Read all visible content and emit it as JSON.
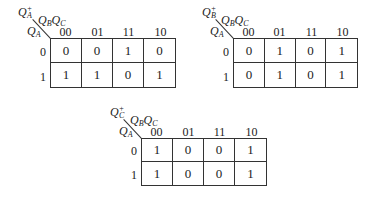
{
  "column_labels": [
    "00",
    "01",
    "11",
    "10"
  ],
  "row_labels": [
    "0",
    "1"
  ],
  "maps": [
    {
      "id": "qa",
      "output": {
        "base": "Q",
        "sub": "A",
        "sup": "+"
      },
      "col_var": {
        "v1": "Q",
        "s1": "B",
        "v2": "Q",
        "s2": "C"
      },
      "row_var": {
        "base": "Q",
        "sub": "A"
      },
      "rows": [
        [
          "0",
          "0",
          "1",
          "0"
        ],
        [
          "1",
          "1",
          "0",
          "1"
        ]
      ]
    },
    {
      "id": "qb",
      "output": {
        "base": "Q",
        "sub": "B",
        "sup": "+"
      },
      "col_var": {
        "v1": "Q",
        "s1": "B",
        "v2": "Q",
        "s2": "C"
      },
      "row_var": {
        "base": "Q",
        "sub": "A"
      },
      "rows": [
        [
          "0",
          "1",
          "0",
          "1"
        ],
        [
          "0",
          "1",
          "0",
          "1"
        ]
      ]
    },
    {
      "id": "qc",
      "output": {
        "base": "Q",
        "sub": "C",
        "sup": "+"
      },
      "col_var": {
        "v1": "Q",
        "s1": "B",
        "v2": "Q",
        "s2": "C"
      },
      "row_var": {
        "base": "Q",
        "sub": "A"
      },
      "rows": [
        [
          "1",
          "0",
          "0",
          "1"
        ],
        [
          "1",
          "0",
          "0",
          "1"
        ]
      ]
    }
  ]
}
